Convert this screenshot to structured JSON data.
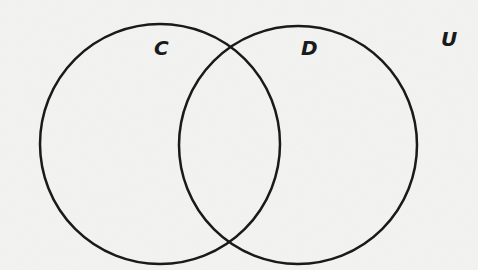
{
  "diagram": {
    "type": "venn",
    "universal_set": {
      "label": "U",
      "x": 441,
      "y": 29
    },
    "sets": [
      {
        "id": "C",
        "label": "C",
        "cx": 160,
        "cy": 144,
        "r": 120,
        "label_x": 154,
        "label_y": 38
      },
      {
        "id": "D",
        "label": "D",
        "cx": 298,
        "cy": 145,
        "r": 119,
        "label_x": 301,
        "label_y": 38
      }
    ],
    "colors": {
      "background": "#f4f4f2",
      "stroke": "#1a1a1a",
      "label": "#1a1a1a"
    },
    "stroke_width": 2.5
  }
}
